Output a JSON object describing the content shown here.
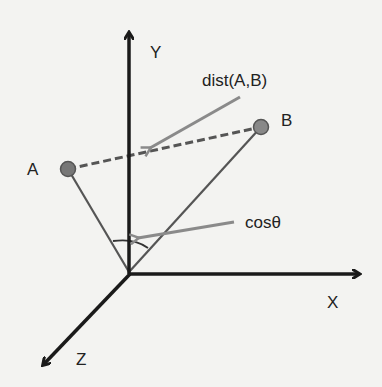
{
  "axes": {
    "x_label": "X",
    "y_label": "Y",
    "z_label": "Z"
  },
  "points": {
    "a_label": "A",
    "b_label": "B"
  },
  "annotations": {
    "distance_label": "dist(A,B)",
    "angle_label": "cosθ"
  },
  "colors": {
    "axis": "#1a1a1a",
    "vector": "#555555",
    "point_fill": "#777777",
    "arrow_gray": "#8a8a8a",
    "background": "#f3f3f1"
  }
}
